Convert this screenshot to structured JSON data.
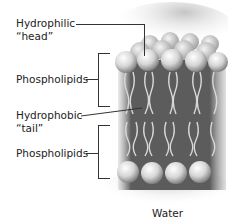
{
  "diagram": {
    "labels": {
      "head_line1": "Hydrophilic",
      "head_line2": "“head”",
      "phospholipids_top": "Phospholipids",
      "tail_line1": "Hydrophobic",
      "tail_line2": "“tail”",
      "phospholipids_bottom": "Phospholipids",
      "water": "Water"
    },
    "colors": {
      "background": "#ffffff",
      "text": "#222222",
      "leader_lines": "#333333",
      "membrane_dark": "#5a5a5a",
      "tail_color": "#d8d8d8",
      "head_light": "#f2f2f2",
      "head_shadow": "#8a8a8a",
      "haze": "#bdbdbd"
    }
  }
}
